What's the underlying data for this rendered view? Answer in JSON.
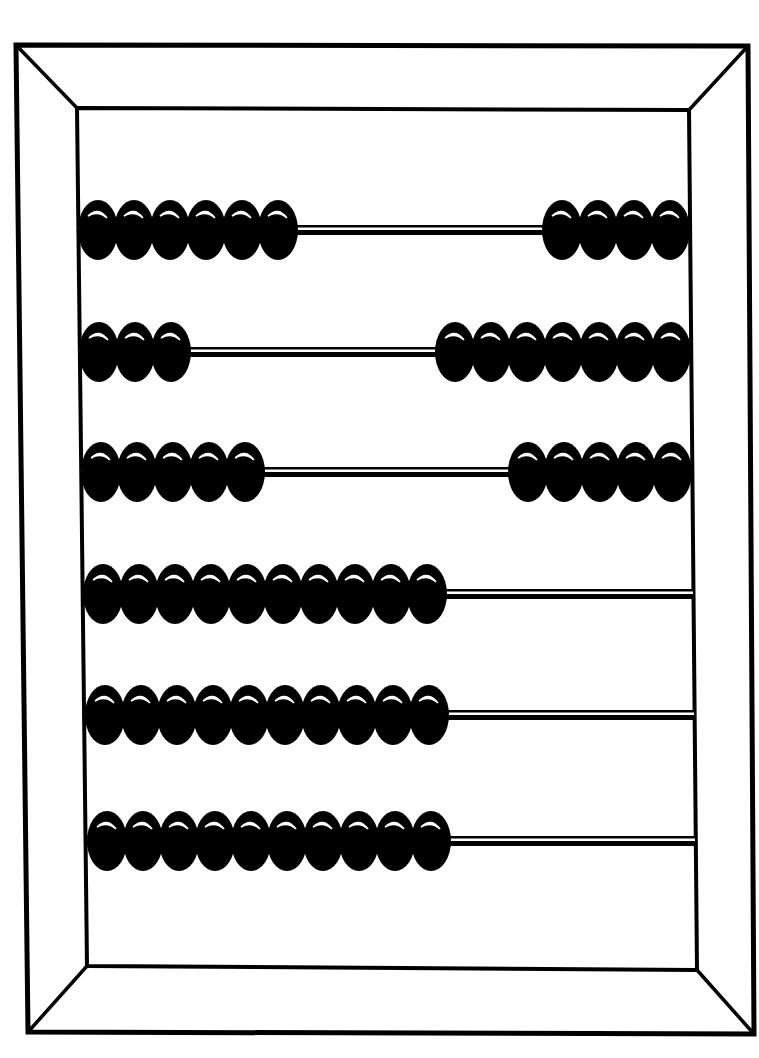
{
  "image": {
    "subject": "abacus",
    "style": "black-and-white line illustration",
    "colors": {
      "ink": "#000000",
      "background": "#ffffff",
      "highlight": "#ffffff"
    }
  },
  "frame": {
    "outer": {
      "tl": [
        16,
        45
      ],
      "tr": [
        748,
        46
      ],
      "br": [
        754,
        1034
      ],
      "bl": [
        28,
        1032
      ]
    },
    "inner": {
      "tl": [
        77,
        108
      ],
      "tr": [
        689,
        110
      ],
      "br": [
        697,
        970
      ],
      "bl": [
        87,
        966
      ]
    }
  },
  "rows": [
    {
      "y": 230,
      "left_beads": 6,
      "right_beads": 4,
      "x_left": 78,
      "x_right": 690
    },
    {
      "y": 352,
      "left_beads": 3,
      "right_beads": 7,
      "x_left": 79,
      "x_right": 691
    },
    {
      "y": 472,
      "left_beads": 5,
      "right_beads": 5,
      "x_left": 81,
      "x_right": 692
    },
    {
      "y": 594,
      "left_beads": 10,
      "right_beads": 0,
      "x_left": 83,
      "x_right": 693
    },
    {
      "y": 715,
      "left_beads": 10,
      "right_beads": 0,
      "x_left": 85,
      "x_right": 694
    },
    {
      "y": 841,
      "left_beads": 10,
      "right_beads": 0,
      "x_left": 87,
      "x_right": 695
    }
  ],
  "bead": {
    "width": 36,
    "height": 60
  }
}
